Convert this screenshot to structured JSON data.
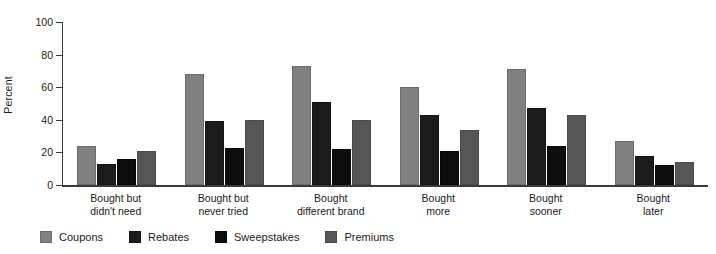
{
  "chart": {
    "ylabel": "Percent",
    "ylim_max": 100,
    "yticks": [
      0,
      20,
      40,
      60,
      80,
      100
    ]
  },
  "chart_data": {
    "type": "bar",
    "title": "",
    "xlabel": "",
    "ylabel": "Percent",
    "ylim": [
      0,
      100
    ],
    "grid": false,
    "legend_position": "bottom-left",
    "categories": [
      "Bought but didn't need",
      "Bought but never tried",
      "Bought different brand",
      "Bought more",
      "Bought sooner",
      "Bought later"
    ],
    "category_lines": [
      [
        "Bought but",
        "didn't need"
      ],
      [
        "Bought but",
        "never tried"
      ],
      [
        "Bought",
        "different brand"
      ],
      [
        "Bought",
        "more"
      ],
      [
        "Bought",
        "sooner"
      ],
      [
        "Bought",
        "later"
      ]
    ],
    "series": [
      {
        "name": "Coupons",
        "color": "#808080",
        "values": [
          24,
          68,
          73,
          60,
          71,
          27
        ]
      },
      {
        "name": "Rebates",
        "color": "#1c1c1c",
        "values": [
          13,
          39,
          51,
          43,
          47,
          18
        ]
      },
      {
        "name": "Sweepstakes",
        "color": "#0d0d0d",
        "values": [
          16,
          23,
          22,
          21,
          24,
          12
        ]
      },
      {
        "name": "Premiums",
        "color": "#565656",
        "values": [
          21,
          40,
          40,
          34,
          43,
          14
        ]
      }
    ]
  }
}
